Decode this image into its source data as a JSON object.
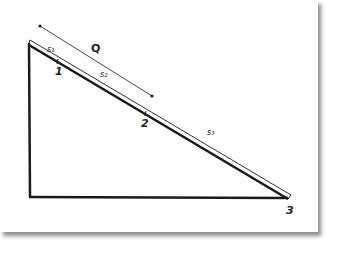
{
  "diagram": {
    "type": "inclined-plane-triangle",
    "colors": {
      "line": "#1a1a1a",
      "background": "#ffffff",
      "shadow": "#8a8a8a"
    },
    "vertices": {
      "top": [
        29,
        44
      ],
      "bottom_left": [
        30,
        197
      ],
      "bottom_right": [
        288,
        198
      ]
    },
    "points": [
      {
        "label": "1",
        "position": [
          58,
          63
        ]
      },
      {
        "label": "2",
        "position": [
          146,
          117
        ]
      },
      {
        "label": "3",
        "position": [
          288,
          198
        ]
      }
    ],
    "segments": [
      {
        "label": "s₁",
        "position": [
          52,
          55
        ]
      },
      {
        "label": "s₂",
        "position": [
          104,
          76
        ]
      },
      {
        "label": "s₃",
        "position": [
          211,
          132
        ]
      }
    ],
    "dimension": {
      "label": "Q",
      "start": [
        40,
        26
      ],
      "end": [
        152,
        96
      ]
    }
  }
}
